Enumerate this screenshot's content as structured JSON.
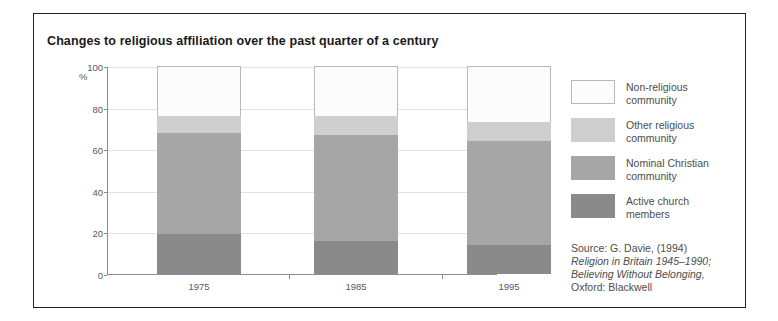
{
  "figure": {
    "title": "Changes to religious affiliation over the past quarter of a century",
    "percent_symbol": "%"
  },
  "chart_data": {
    "type": "bar",
    "stacked": true,
    "title": "Changes to religious affiliation over the past quarter of a century",
    "xlabel": "",
    "ylabel": "%",
    "ylim": [
      0,
      100
    ],
    "yticks": [
      0,
      20,
      40,
      60,
      80,
      100
    ],
    "grid": true,
    "legend_position": "right",
    "categories": [
      "1975",
      "1985",
      "1995"
    ],
    "series": [
      {
        "name": "Active church members",
        "values": [
          19,
          16,
          14
        ],
        "color": "#8a8a8a"
      },
      {
        "name": "Nominal Christian community",
        "values": [
          49,
          51,
          50
        ],
        "color": "#a6a6a6"
      },
      {
        "name": "Other religious community",
        "values": [
          8,
          9,
          9
        ],
        "color": "#cfcfcf"
      },
      {
        "name": "Non-religious community",
        "values": [
          24,
          24,
          27
        ],
        "color": "#fcfcfc"
      }
    ],
    "cumulative_tops": {
      "1975": {
        "active": 19,
        "nominal": 68,
        "other": 76,
        "non_religious": 100
      },
      "1985": {
        "active": 16,
        "nominal": 67,
        "other": 76,
        "non_religious": 100
      },
      "1995": {
        "active": 14,
        "nominal": 64,
        "other": 73,
        "non_religious": 100
      }
    }
  },
  "legend": {
    "items": [
      {
        "label_line1": "Non-religious",
        "label_line2": "community",
        "color": "#fcfcfc",
        "outlined": true
      },
      {
        "label_line1": "Other religious",
        "label_line2": "community",
        "color": "#cfcfcf",
        "outlined": false
      },
      {
        "label_line1": "Nominal Christian",
        "label_line2": "community",
        "color": "#a6a6a6",
        "outlined": false
      },
      {
        "label_line1": "Active church",
        "label_line2": "members",
        "color": "#8a8a8a",
        "outlined": false
      }
    ]
  },
  "source": {
    "line1": "Source: G. Davie, (1994)",
    "line2": "Religion in Britain 1945–1990;",
    "line3": "Believing Without Belonging,",
    "line4": "Oxford: Blackwell"
  }
}
